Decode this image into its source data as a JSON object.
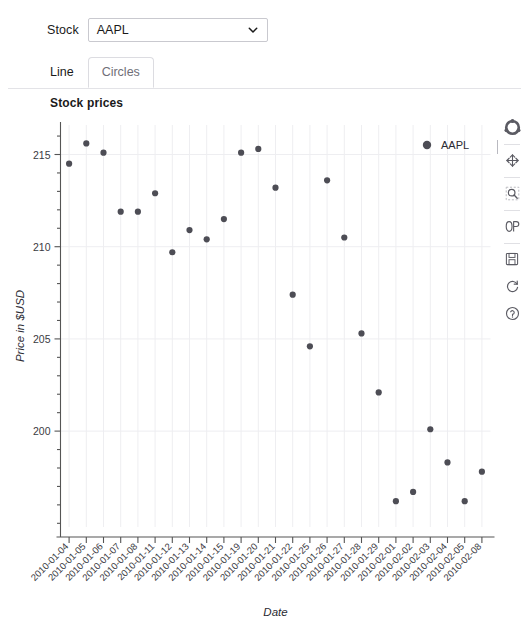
{
  "top_clip": {
    "text": ""
  },
  "controls": {
    "stock_label": "Stock",
    "stock_value": "AAPL",
    "stock_options": [
      "AAPL"
    ],
    "caret_icon": "chevron-down-icon"
  },
  "tabs": [
    {
      "label": "Line",
      "active": false
    },
    {
      "label": "Circles",
      "active": true
    }
  ],
  "toolbar": {
    "tools": [
      {
        "name": "bokeh-logo-icon",
        "label": "Bokeh"
      },
      {
        "name": "pan-icon",
        "label": "Pan"
      },
      {
        "name": "box-zoom-icon",
        "label": "Box Zoom"
      },
      {
        "name": "wheel-zoom-icon",
        "label": "Wheel Zoom"
      },
      {
        "name": "save-icon",
        "label": "Save"
      },
      {
        "name": "reset-icon",
        "label": "Reset"
      },
      {
        "name": "help-icon",
        "label": "Help"
      }
    ]
  },
  "chart_data": {
    "type": "scatter",
    "title": "Stock prices",
    "xlabel": "Date",
    "ylabel": "Price in $USD",
    "legend": [
      {
        "name": "AAPL",
        "color": "#4d4d55",
        "marker": "circle"
      }
    ],
    "legend_position": "top-right",
    "grid": true,
    "ylim": [
      194.8,
      216.6
    ],
    "yticks": [
      200,
      205,
      210,
      215
    ],
    "categories": [
      "2010-01-04",
      "2010-01-05",
      "2010-01-06",
      "2010-01-07",
      "2010-01-08",
      "2010-01-11",
      "2010-01-12",
      "2010-01-13",
      "2010-01-14",
      "2010-01-15",
      "2010-01-19",
      "2010-01-20",
      "2010-01-21",
      "2010-01-22",
      "2010-01-25",
      "2010-01-26",
      "2010-01-27",
      "2010-01-28",
      "2010-01-29",
      "2010-02-01",
      "2010-02-02",
      "2010-02-03",
      "2010-02-04",
      "2010-02-05",
      "2010-02-08"
    ],
    "series": [
      {
        "name": "AAPL",
        "color": "#4d4d55",
        "values": [
          214.5,
          215.6,
          215.1,
          211.9,
          211.9,
          212.9,
          209.7,
          210.9,
          210.4,
          211.5,
          215.1,
          215.3,
          213.2,
          207.4,
          204.6,
          213.6,
          210.5,
          205.3,
          202.1,
          196.2,
          196.7,
          200.1,
          198.3,
          196.2,
          197.8
        ]
      }
    ]
  }
}
